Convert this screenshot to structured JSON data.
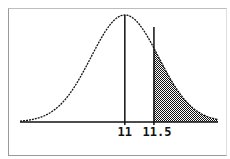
{
  "chart_data": {
    "type": "area",
    "title": "",
    "xlabel": "",
    "ylabel": "",
    "distribution": "normal",
    "mean": 11,
    "std_dev": 0.58,
    "xlim": [
      9.2,
      12.6
    ],
    "shaded_region": {
      "from": 11.5,
      "to": 12.6
    },
    "vertical_markers": [
      11,
      11.5
    ],
    "tick_labels": [
      {
        "x": 11,
        "label": "11"
      },
      {
        "x": 11.5,
        "label": "11.5"
      }
    ],
    "grid": false,
    "legend": "none",
    "colors": {
      "line": "#111111",
      "axis": "#111111",
      "shade": "#111111",
      "background": "#ffffff"
    }
  }
}
